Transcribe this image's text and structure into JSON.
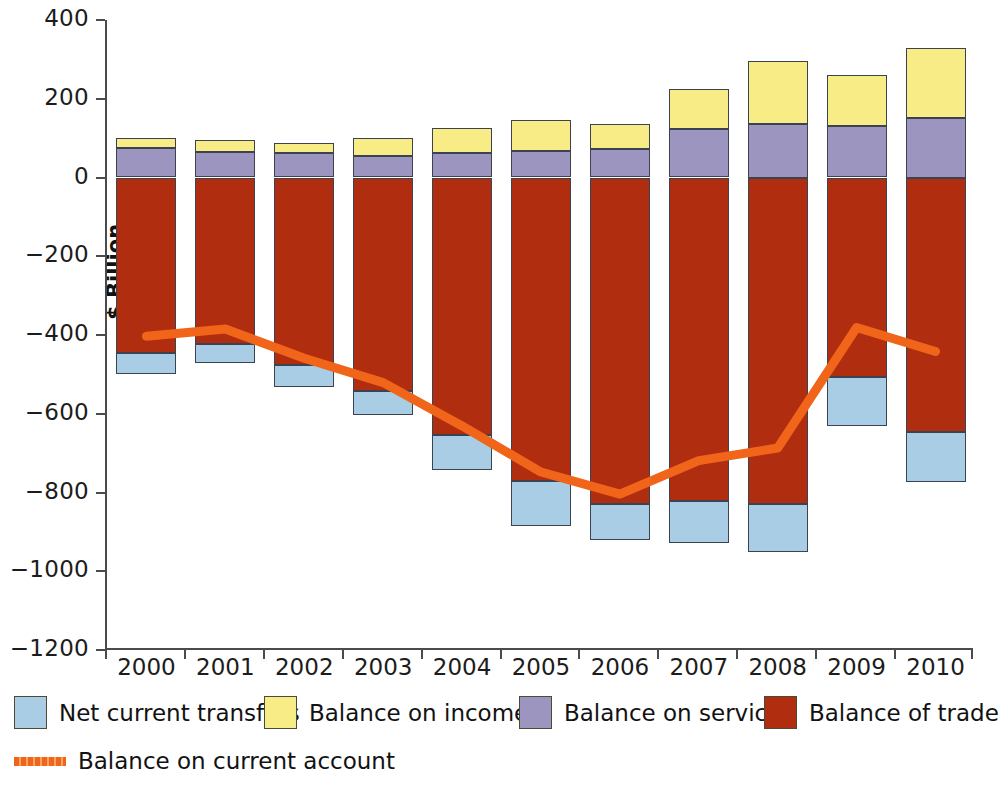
{
  "chart_data": {
    "type": "bar",
    "title": "",
    "xlabel": "",
    "ylabel": "$ Billion",
    "ylim": [
      -1200,
      400
    ],
    "ytick_values": [
      400,
      200,
      0,
      -200,
      -400,
      -600,
      -800,
      -1000,
      -1200
    ],
    "ytick_labels": [
      "400",
      "200",
      "0",
      "−200",
      "−400",
      "−600",
      "−800",
      "−1000",
      "−1200"
    ],
    "grid": false,
    "stacked": true,
    "legend_position": "bottom",
    "categories": [
      "2000",
      "2001",
      "2002",
      "2003",
      "2004",
      "2005",
      "2006",
      "2007",
      "2008",
      "2009",
      "2010"
    ],
    "series": [
      {
        "name": "Balance of trade",
        "color": "#b02d10",
        "values": [
          -446,
          -422,
          -475,
          -541,
          -655,
          -772,
          -828,
          -821,
          -830,
          -506,
          -646
        ]
      },
      {
        "name": "Balance on services",
        "color": "#9c95c0",
        "values": [
          74,
          64,
          61,
          54,
          62,
          68,
          72,
          122,
          135,
          132,
          150
        ]
      },
      {
        "name": "Balance on income",
        "color": "#f7ec86",
        "values": [
          26,
          30,
          27,
          46,
          63,
          79,
          65,
          104,
          162,
          128,
          180
        ]
      },
      {
        "name": "Net current transfers",
        "color": "#a8cde5",
        "values": [
          -54,
          -49,
          -57,
          -63,
          -88,
          -113,
          -93,
          -108,
          -120,
          -125,
          -128
        ]
      }
    ],
    "line_series": {
      "name": "Balance on current account",
      "color": "#f0651a",
      "values": [
        -403,
        -385,
        -459,
        -521,
        -631,
        -748,
        -804,
        -719,
        -687,
        -381,
        -442
      ]
    }
  },
  "legend": {
    "items": [
      {
        "label": "Net current transfers",
        "marker": "square",
        "color": "#a8cde5"
      },
      {
        "label": "Balance on income",
        "marker": "square",
        "color": "#f7ec86"
      },
      {
        "label": "Balance on services",
        "marker": "square",
        "color": "#9c95c0"
      },
      {
        "label": "Balance of trade",
        "marker": "square",
        "color": "#b02d10"
      },
      {
        "label": "Balance on current account",
        "marker": "line",
        "color": "#f0651a"
      }
    ]
  }
}
